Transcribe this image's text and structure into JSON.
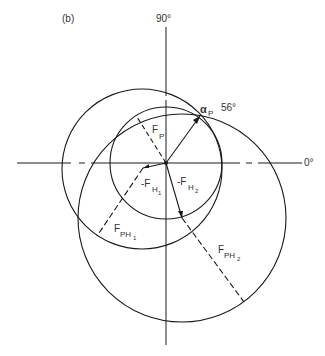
{
  "figure": {
    "panel_label": "(b)",
    "axis_labels": {
      "top": "90°",
      "right": "0°"
    },
    "angle": {
      "symbol": "α",
      "subscript": "P",
      "value": "56°"
    },
    "vectors": [
      {
        "name": "F_P",
        "main": "F",
        "sub": "P",
        "style": "dashed"
      },
      {
        "name": "-F_H1",
        "main": "-F",
        "sub": "H",
        "subsub": "1",
        "style": "solid"
      },
      {
        "name": "-F_H2",
        "main": "-F",
        "sub": "H",
        "subsub": "2",
        "style": "solid"
      },
      {
        "name": "F_PH1",
        "main": "F",
        "sub": "PH",
        "subsub": "1",
        "style": "dashed"
      },
      {
        "name": "F_PH2",
        "main": "F",
        "sub": "PH",
        "subsub": "2",
        "style": "dashed"
      }
    ],
    "circles": [
      {
        "name": "F_P circle",
        "center": "origin"
      },
      {
        "name": "F_PH1 circle",
        "center": "-F_H1 tip"
      },
      {
        "name": "F_PH2 circle",
        "center": "-F_H2 tip"
      }
    ],
    "line_color": "#1a1a1a"
  }
}
